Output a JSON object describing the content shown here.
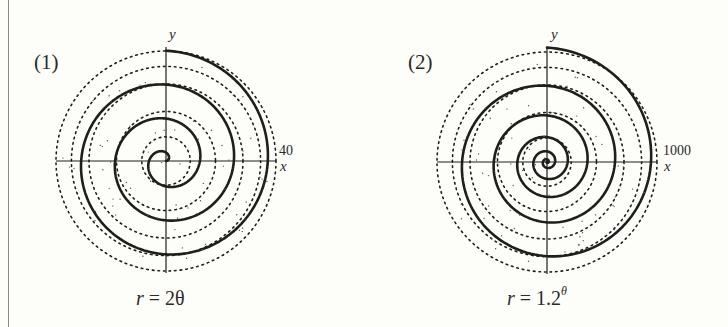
{
  "panels": [
    {
      "tag": "(1)",
      "y_axis_label": "y",
      "x_axis_label": "x",
      "tick_label": "40",
      "caption": {
        "lhs": "r",
        "eq": " = ",
        "rhs": "2θ",
        "sup": ""
      },
      "center": [
        166,
        161
      ],
      "radius_px": 110
    },
    {
      "tag": "(2)",
      "y_axis_label": "y",
      "x_axis_label": "x",
      "tick_label": "1000",
      "caption": {
        "lhs": "r",
        "eq": " = ",
        "rhs": "1.2",
        "sup": "θ"
      },
      "center": [
        547,
        162
      ],
      "radius_px": 110
    }
  ],
  "chart_data": [
    {
      "type": "line",
      "title": "(1)",
      "subtitle": "r = 2θ",
      "kind": "polar spiral (Archimedean)",
      "equation": "r = 2*theta",
      "theta_range": [
        0,
        20.42
      ],
      "theta_range_label": "0 to 6.5π",
      "x": [
        0,
        1.571,
        3.142,
        4.712,
        6.283,
        7.854,
        9.425,
        10.996,
        12.566,
        14.137,
        15.708,
        17.279,
        18.85,
        20.42
      ],
      "y": [
        0,
        3.14,
        6.28,
        9.42,
        12.57,
        15.71,
        18.85,
        21.99,
        25.13,
        28.27,
        31.42,
        34.56,
        37.7,
        40.84
      ],
      "xlabel": "x",
      "ylabel": "y",
      "axis_tick_labels": [
        "40"
      ],
      "r_max": 40,
      "grid": "dotted concentric circles",
      "legend": null
    },
    {
      "type": "line",
      "title": "(2)",
      "subtitle": "r = 1.2^θ",
      "kind": "polar spiral (logarithmic)",
      "equation": "r = 1.2^theta",
      "theta_range": [
        0,
        39.27
      ],
      "theta_range_label": "0 to 12.5π",
      "x": [
        0,
        6.283,
        12.566,
        18.85,
        25.133,
        31.416,
        37.699
      ],
      "y": [
        1,
        3.14,
        9.87,
        31.0,
        97.5,
        306.3,
        962.7
      ],
      "xlabel": "x",
      "ylabel": "y",
      "axis_tick_labels": [
        "1000"
      ],
      "r_max": 1000,
      "grid": "dotted concentric circles",
      "legend": null
    }
  ]
}
